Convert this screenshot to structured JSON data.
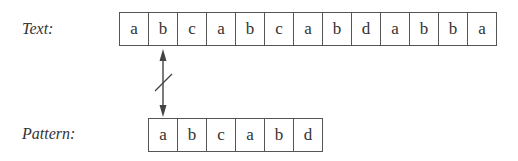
{
  "labels": {
    "text": "Text:",
    "pattern": "Pattern:"
  },
  "text_row": {
    "cells": [
      "a",
      "b",
      "c",
      "a",
      "b",
      "c",
      "a",
      "b",
      "d",
      "a",
      "b",
      "b",
      "a"
    ]
  },
  "pattern_row": {
    "cells": [
      "a",
      "b",
      "c",
      "a",
      "b",
      "d"
    ]
  },
  "comparison": {
    "text_index": 1,
    "pattern_index": 0,
    "result": "mismatch",
    "icon": "double-arrow-with-slash-icon"
  }
}
